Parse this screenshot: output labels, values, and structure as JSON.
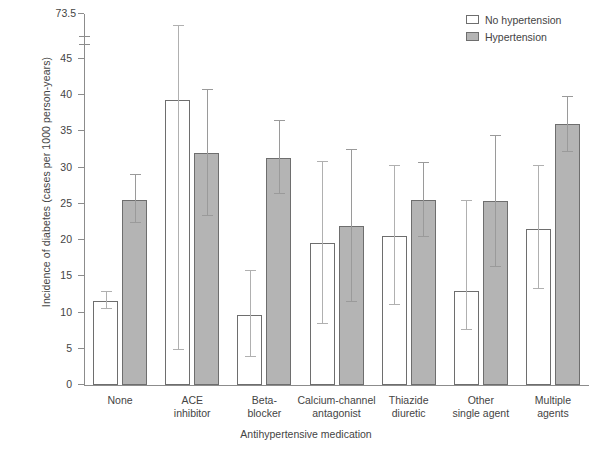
{
  "chart_data": {
    "type": "bar",
    "title": "",
    "xlabel": "Antihypertensive medication",
    "ylabel": "Incidence of diabetes (cases per 1000 person-years)",
    "ylim": [
      0,
      45
    ],
    "y_axis_break": {
      "below": 45,
      "above": 73.5,
      "note": "axis broken between 45 and 73.5"
    },
    "yticks": [
      "0",
      "5",
      "10",
      "15",
      "20",
      "25",
      "30",
      "35",
      "40",
      "45",
      "73.5"
    ],
    "grid": false,
    "legend_position": "top-right",
    "categories": [
      "None",
      "ACE inhibitor",
      "Beta-blocker",
      "Calcium-channel antagonist",
      "Thiazide diuretic",
      "Other single agent",
      "Multiple agents"
    ],
    "category_lines": [
      [
        "None",
        ""
      ],
      [
        "ACE",
        "inhibitor"
      ],
      [
        "Beta-",
        "blocker"
      ],
      [
        "Calcium-channel",
        "antagonist"
      ],
      [
        "Thiazide",
        "diuretic"
      ],
      [
        "Other",
        "single agent"
      ],
      [
        "Multiple",
        "agents"
      ]
    ],
    "series": [
      {
        "name": "No hypertension",
        "fill": "#ffffff",
        "values": [
          11.6,
          39.3,
          9.7,
          19.6,
          20.6,
          13.0,
          21.6
        ],
        "ci_low": [
          10.5,
          4.9,
          3.9,
          8.4,
          11.0,
          7.6,
          13.2
        ],
        "ci_high": [
          12.8,
          73.5,
          15.8,
          30.8,
          30.3,
          25.4,
          30.3
        ]
      },
      {
        "name": "Hypertension",
        "fill": "#b4b4b4",
        "values": [
          25.5,
          32.0,
          31.3,
          22.0,
          25.5,
          25.4,
          36.0
        ],
        "ci_low": [
          22.3,
          23.3,
          26.4,
          11.5,
          20.5,
          16.3,
          32.2
        ],
        "ci_high": [
          29.0,
          40.7,
          36.5,
          32.5,
          30.6,
          34.4,
          39.8
        ]
      }
    ]
  },
  "legend": {
    "items": [
      {
        "label": "No hypertension",
        "swatch": "open"
      },
      {
        "label": "Hypertension",
        "swatch": "filled"
      }
    ]
  },
  "colors": {
    "bar_fill_hypertension": "#b4b4b4",
    "bar_fill_no_hypertension": "#ffffff",
    "bar_border": "#6e6e6e",
    "axis": "#8c8c8c",
    "error_bar": "#b0b0b0",
    "text": "#444444"
  }
}
